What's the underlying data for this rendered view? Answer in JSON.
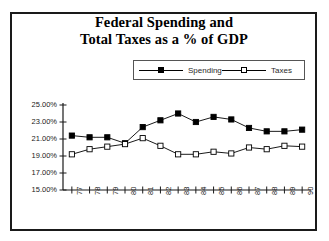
{
  "chart_data": {
    "type": "line",
    "title": "Federal Spending and Total Taxes as a % of GDP",
    "title_lines": [
      "Federal Spending and",
      "Total Taxes as a % of GDP"
    ],
    "xlabel": "",
    "ylabel": "",
    "grid": false,
    "legend_position": "top-center",
    "categories": [
      "77",
      "78",
      "79",
      "80",
      "81",
      "82",
      "83",
      "84",
      "85",
      "86",
      "87",
      "88",
      "89",
      "90"
    ],
    "ylim": [
      15.0,
      25.0
    ],
    "ytick_labels": [
      "25.00%",
      "23.00%",
      "21.00%",
      "19.00%",
      "17.00%",
      "15.00%"
    ],
    "ytick_values": [
      25.0,
      23.0,
      21.0,
      19.0,
      17.0,
      15.0
    ],
    "series": [
      {
        "name": "Spending",
        "marker": "filled-square",
        "color": "#000000",
        "values": [
          21.4,
          21.2,
          21.2,
          20.5,
          22.4,
          23.2,
          24.0,
          23.0,
          23.6,
          23.3,
          22.3,
          21.9,
          21.9,
          22.1
        ]
      },
      {
        "name": "Taxes",
        "marker": "hollow-square",
        "color": "#000000",
        "values": [
          19.2,
          19.8,
          20.1,
          20.4,
          21.1,
          20.2,
          19.2,
          19.2,
          19.5,
          19.3,
          20.0,
          19.8,
          20.2,
          20.1
        ]
      }
    ]
  },
  "legend": {
    "entries": [
      {
        "label": "Spending",
        "marker": "filled-square"
      },
      {
        "label": "Taxes",
        "marker": "hollow-square"
      }
    ]
  },
  "colors": {
    "frame": "#1a1a1a",
    "axis": "#1a1a1a",
    "series": "#000000",
    "background": "#ffffff"
  }
}
